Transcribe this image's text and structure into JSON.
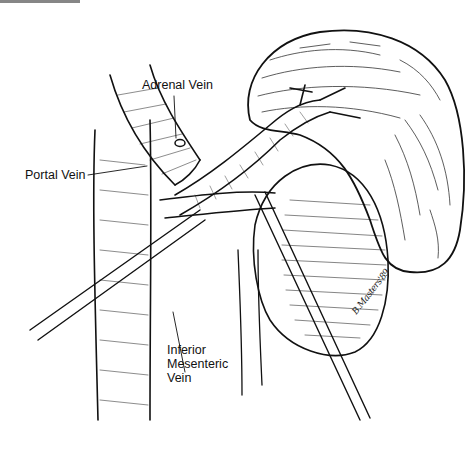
{
  "figure": {
    "labels": {
      "adrenal_vein": "Adrenal Vein",
      "portal_vein": "Portal Vein",
      "inferior_mesenteric_vein_line1": "Inferior",
      "inferior_mesenteric_vein_line2": "Mesenteric",
      "inferior_mesenteric_vein_line3": "Vein"
    },
    "signature": "B.Masters'89",
    "colors": {
      "ink": "#111111",
      "background": "#ffffff"
    }
  }
}
